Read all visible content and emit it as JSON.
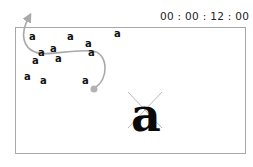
{
  "timecode": "00 : 00 : 12 : 00",
  "small_glyphs": [
    {
      "char": "a",
      "x": 29,
      "y": 40
    },
    {
      "char": "a",
      "x": 67,
      "y": 40
    },
    {
      "char": "a",
      "x": 114,
      "y": 37
    },
    {
      "char": "a",
      "x": 85,
      "y": 47
    },
    {
      "char": "a",
      "x": 50,
      "y": 52
    },
    {
      "char": "a",
      "x": 38,
      "y": 56
    },
    {
      "char": "a",
      "x": 88,
      "y": 56
    },
    {
      "char": "a",
      "x": 32,
      "y": 64
    },
    {
      "char": "a",
      "x": 55,
      "y": 62
    },
    {
      "char": "a",
      "x": 24,
      "y": 80
    },
    {
      "char": "a",
      "x": 40,
      "y": 84
    },
    {
      "char": "a",
      "x": 82,
      "y": 84
    }
  ],
  "large_glyph": {
    "char": "a",
    "x": 146,
    "y": 131
  },
  "path_color": "#a9a9a9",
  "motion_path": "M94,88 C110,80 108,52 92,51 C70,49 45,57 35,52 C24,48 19,35 29,17",
  "end_dot": {
    "x": 94,
    "y": 89,
    "r": 3.5
  },
  "cross_color": "#bbbbbb"
}
